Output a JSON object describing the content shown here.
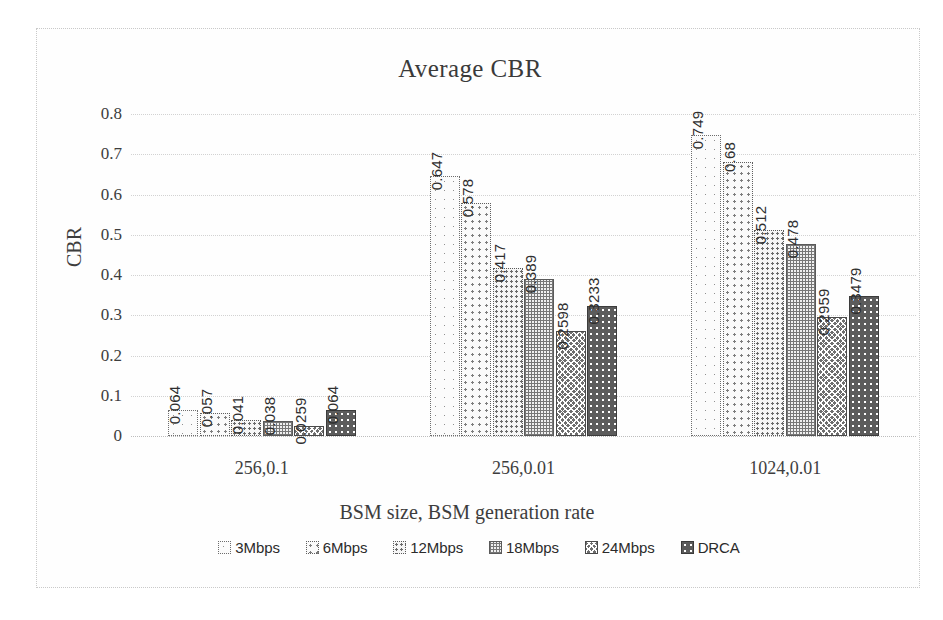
{
  "chart_data": {
    "type": "bar",
    "title": "Average CBR",
    "xlabel": "BSM size, BSM generation rate",
    "ylabel": "CBR",
    "ylim": [
      0,
      0.8
    ],
    "yticks": [
      "0",
      "0.1",
      "0.2",
      "0.3",
      "0.4",
      "0.5",
      "0.6",
      "0.7",
      "0.8"
    ],
    "grid": true,
    "legend_position": "bottom",
    "categories": [
      "256,0.1",
      "256,0.01",
      "1024,0.01"
    ],
    "series": [
      {
        "name": "3Mbps",
        "values": [
          0.064,
          0.647,
          0.749
        ]
      },
      {
        "name": "6Mbps",
        "values": [
          0.057,
          0.578,
          0.68
        ]
      },
      {
        "name": "12Mbps",
        "values": [
          0.041,
          0.417,
          0.512
        ]
      },
      {
        "name": "18Mbps",
        "values": [
          0.038,
          0.389,
          0.478
        ]
      },
      {
        "name": "24Mbps",
        "values": [
          0.0259,
          0.2598,
          0.2959
        ]
      },
      {
        "name": "DRCA",
        "values": [
          0.064,
          0.3233,
          0.3479
        ]
      }
    ],
    "data_labels": [
      [
        "0.064",
        "0.057",
        "0.041",
        "0.038",
        "0.0259",
        "0.064"
      ],
      [
        "0.647",
        "0.578",
        "0.417",
        "0.389",
        "0.2598",
        "0.3233"
      ],
      [
        "0.749",
        "0.68",
        "0.512",
        "0.478",
        "0.2959",
        "0.3479"
      ]
    ]
  },
  "legend": {
    "items": [
      {
        "label": "3Mbps",
        "swatch": "pattern-sparse-dots"
      },
      {
        "label": "6Mbps",
        "swatch": "pattern-medium-dots"
      },
      {
        "label": "12Mbps",
        "swatch": "pattern-dense-dots"
      },
      {
        "label": "18Mbps",
        "swatch": "pattern-fine-grid"
      },
      {
        "label": "24Mbps",
        "swatch": "pattern-crosshatch"
      },
      {
        "label": "DRCA",
        "swatch": "pattern-dark-dots"
      }
    ]
  }
}
